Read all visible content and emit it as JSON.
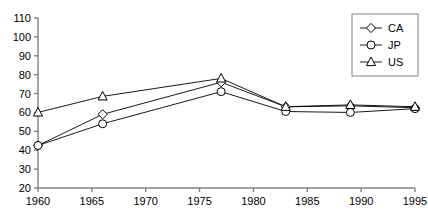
{
  "chart_data": {
    "type": "line",
    "title": "",
    "subtitle": "",
    "xlabel": "",
    "ylabel": "",
    "x": [
      1960,
      1966,
      1977,
      1983,
      1989,
      1995
    ],
    "xlim": [
      1960,
      1995
    ],
    "ylim": [
      20,
      110
    ],
    "xticks": [
      1960,
      1965,
      1970,
      1975,
      1980,
      1985,
      1990,
      1995
    ],
    "xtick_labels": [
      "1960",
      "1965",
      "1970",
      "1975",
      "1980",
      "1985",
      "1990",
      "1995"
    ],
    "yticks": [
      20,
      30,
      40,
      50,
      60,
      70,
      80,
      90,
      100,
      110
    ],
    "ytick_labels": [
      "20",
      "30",
      "40",
      "50",
      "60",
      "70",
      "80",
      "90",
      "100",
      "110"
    ],
    "grid": false,
    "legend_position": "top-right",
    "series": [
      {
        "name": "CA",
        "marker": "diamond",
        "color": "#000000",
        "values": [
          42.5,
          59,
          76,
          63,
          63.5,
          62.5
        ]
      },
      {
        "name": "JP",
        "marker": "circle",
        "color": "#000000",
        "values": [
          42.5,
          54,
          71,
          60.5,
          60,
          62
        ]
      },
      {
        "name": "US",
        "marker": "triangle",
        "color": "#000000",
        "values": [
          60,
          68.5,
          78,
          63,
          64,
          63
        ]
      }
    ]
  },
  "legend": {
    "entries": [
      {
        "label": "CA",
        "marker": "diamond"
      },
      {
        "label": "JP",
        "marker": "circle"
      },
      {
        "label": "US",
        "marker": "triangle"
      }
    ]
  },
  "axes": {
    "line_color": "#808080",
    "marker_fill": "#ffffff",
    "marker_stroke": "#000000"
  }
}
